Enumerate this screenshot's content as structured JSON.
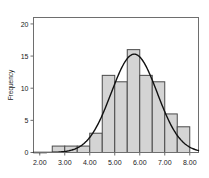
{
  "chart_data": {
    "type": "bar",
    "title": "",
    "subtitle": "",
    "xlabel": "",
    "ylabel": "Frequency",
    "xlim": [
      1.75,
      8.35
    ],
    "ylim": [
      0,
      21
    ],
    "grid": false,
    "legend": null,
    "bin_width": 0.5,
    "categories": [
      "2.50-3.00",
      "3.00-3.50",
      "3.50-4.00",
      "4.00-4.50",
      "4.50-5.00",
      "5.00-5.50",
      "5.50-6.00",
      "6.00-6.50",
      "6.50-7.00",
      "7.00-7.50",
      "7.50-8.00"
    ],
    "bin_edges": [
      2.5,
      3.0,
      3.5,
      4.0,
      4.5,
      5.0,
      5.5,
      6.0,
      6.5,
      7.0,
      7.5,
      8.0
    ],
    "values": [
      1,
      1,
      1,
      3,
      12,
      11,
      16,
      12,
      11,
      6,
      4
    ],
    "x_ticks": [
      2.0,
      3.0,
      4.0,
      5.0,
      6.0,
      7.0,
      8.0
    ],
    "x_tick_labels": [
      "2.00",
      "3.00",
      "4.00",
      "5.00",
      "6.00",
      "7.00",
      "8.00"
    ],
    "y_ticks": [
      0,
      5,
      10,
      15,
      20
    ],
    "y_tick_labels": [
      "0",
      "5",
      "10",
      "15",
      "20"
    ],
    "bar_fill_color": "#d4d4d4",
    "bar_border_color": "#4a4a4a",
    "curve_color": "#111111",
    "axis_color": "#6e6e6e",
    "overlay_curve": {
      "name": "normal",
      "mean": 5.78,
      "std": 0.92,
      "peak_value": 15.3,
      "visible": true
    }
  }
}
